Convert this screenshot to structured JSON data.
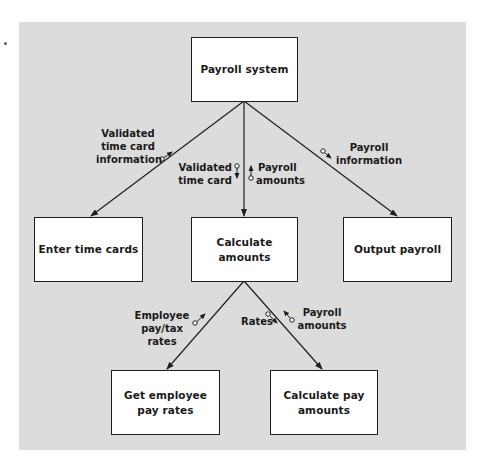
{
  "diagram": {
    "type": "structure chart",
    "modules": {
      "root": "Payroll system",
      "enter": "Enter time cards",
      "calc": "Calculate amounts",
      "output": "Output payroll",
      "get_rates_1": "Get employee",
      "get_rates_2": "pay rates",
      "calc_pay_1": "Calculate pay",
      "calc_pay_2": "amounts"
    },
    "couples": {
      "validated_info_1": "Validated",
      "validated_info_2": "time card",
      "validated_info_3": "information",
      "validated_card_1": "Validated",
      "validated_card_2": "time card",
      "payroll_amounts_1": "Payroll",
      "payroll_amounts_2": "amounts",
      "payroll_info_1": "Payroll",
      "payroll_info_2": "information",
      "emp_rates_1": "Employee",
      "emp_rates_2": "pay/tax rates",
      "rates": "Rates",
      "pay_amounts_1": "Payroll",
      "pay_amounts_2": "amounts"
    },
    "colors": {
      "panel": "#dcdcdc",
      "box": "#ffffff",
      "line": "#1e1e1e"
    }
  }
}
